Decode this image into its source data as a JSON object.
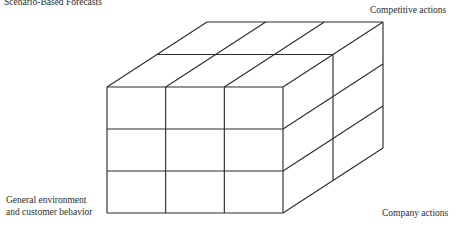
{
  "figure": {
    "type": "3d-grid-cuboid-diagram",
    "title": "Scenario-Based Forecasts",
    "background_color": "#ffffff",
    "line_color": "#2d2d2d",
    "axes": [
      {
        "name": "competitive-actions",
        "label": "Competitive actions",
        "position": "top-right",
        "divisions": 2
      },
      {
        "name": "company-actions",
        "label": "Company actions",
        "position": "bottom-right",
        "divisions": 3
      },
      {
        "name": "general-environment",
        "label_line_1": "General environment",
        "label_line_2": "and customer behavior",
        "position": "bottom-left",
        "divisions": 3
      }
    ],
    "geometry": {
      "front_left": 107,
      "front_right": 283,
      "front_top": 87,
      "front_bottom": 213,
      "depth_dx": 100,
      "depth_dy": -65,
      "cols": 3,
      "rows": 3,
      "depth_steps": 2
    }
  }
}
